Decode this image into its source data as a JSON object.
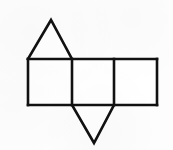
{
  "figure": {
    "name": "geometric-net",
    "background_color": "#fdfdfd",
    "stroke_color": "#111111",
    "fill_color": "#ffffff",
    "stroke_width": 2.6,
    "canvas": {
      "width": 173,
      "height": 150
    },
    "shapes": [
      {
        "id": "square-left",
        "label": "left-square",
        "type": "square",
        "points": "28,59 72,59 72,105 28,105"
      },
      {
        "id": "square-middle",
        "label": "middle-square",
        "type": "square",
        "points": "72,59 114,59 114,105 72,105"
      },
      {
        "id": "square-right",
        "label": "right-square",
        "type": "square",
        "points": "114,59 157,59 157,105 114,105"
      },
      {
        "id": "triangle-top",
        "label": "top-triangle",
        "type": "triangle",
        "points": "28,59 72,59 51,20"
      },
      {
        "id": "triangle-bottom",
        "label": "bottom-triangle",
        "type": "triangle",
        "points": "72,105 114,105 94,143"
      }
    ],
    "edges": [
      {
        "id": "edge-top-row",
        "label": "top-edge-of-squares",
        "d": "M 28,59 L 157,59"
      },
      {
        "id": "edge-bottom-row",
        "label": "bottom-edge-of-squares",
        "d": "M 28,105 L 157,105"
      },
      {
        "id": "edge-left-side",
        "label": "left-side-of-left-square",
        "d": "M 28,59 L 28,105"
      },
      {
        "id": "edge-divider-1",
        "label": "divider-left-middle",
        "d": "M 72,59 L 72,105"
      },
      {
        "id": "edge-divider-2",
        "label": "divider-middle-right",
        "d": "M 114,59 L 114,105"
      },
      {
        "id": "edge-right-side",
        "label": "right-side-of-right-square",
        "d": "M 157,59 L 157,105"
      },
      {
        "id": "edge-triangle-top",
        "label": "top-triangle-sides",
        "d": "M 28,59 L 51,20 L 72,59"
      },
      {
        "id": "edge-triangle-bottom",
        "label": "bottom-triangle-sides",
        "d": "M 72,105 L 94,143 L 114,105"
      }
    ]
  }
}
